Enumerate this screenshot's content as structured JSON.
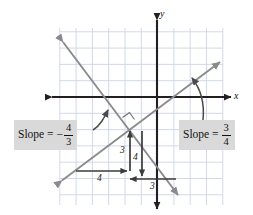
{
  "figure": {
    "kind": "coordinate-plane-slope-diagram",
    "axes": {
      "x_label": "x",
      "y_label": "y",
      "origin_px": [
        157,
        97
      ],
      "grid_spacing_px": 16.3,
      "grid_color": "#cdd5e4",
      "axis_color": "#231f20"
    },
    "lines": [
      {
        "name": "positive-slope-line",
        "slope": "3/4",
        "slope_value": 0.75,
        "color": "#8a8a8a",
        "direction": "rising",
        "arrows": "both"
      },
      {
        "name": "negative-slope-line",
        "slope": "-4/3",
        "slope_value": -1.3333,
        "color": "#8a8a8a",
        "direction": "falling",
        "arrows": "both"
      }
    ],
    "labels": {
      "left": {
        "name": "slope-label-negative",
        "text": "Slope =",
        "sign": "−",
        "numerator": "4",
        "denominator": "3",
        "background": "#d9d9d9"
      },
      "right": {
        "name": "slope-label-positive",
        "text": "Slope =",
        "sign": "",
        "numerator": "3",
        "denominator": "4",
        "background": "#d9d9d9"
      }
    },
    "rise_run": {
      "positive": {
        "run_label": "4",
        "rise_label": "3",
        "run_direction": "right",
        "rise_direction": "up"
      },
      "negative": {
        "rise_label": "4",
        "run_label": "3",
        "rise_direction": "down",
        "run_direction": "left"
      }
    },
    "markers": {
      "right_angle": {
        "name": "right-angle-marker",
        "present": true
      },
      "pointer_left": {
        "name": "curved-pointer-to-negative-line",
        "present": true
      },
      "pointer_right": {
        "name": "curved-pointer-to-positive-line",
        "present": true
      }
    }
  }
}
